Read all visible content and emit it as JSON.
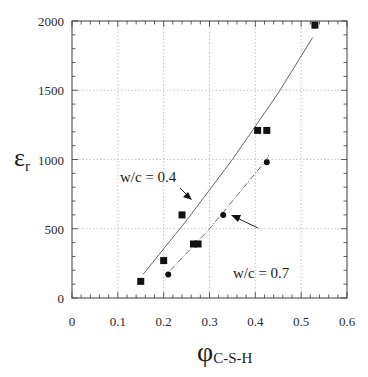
{
  "chart_data": {
    "type": "scatter",
    "title": "",
    "xlabel": "φ",
    "xlabel_subscript": "C-S-H",
    "ylabel": "ε",
    "ylabel_subscript": "r",
    "xlim": [
      0,
      0.6
    ],
    "ylim": [
      0,
      2000
    ],
    "x_ticks": [
      "0",
      "0.1",
      "0.2",
      "0.3",
      "0.4",
      "0.5",
      "0.6"
    ],
    "y_ticks": [
      "0",
      "500",
      "1000",
      "1500",
      "2000"
    ],
    "grid": true,
    "grid_style": "dotted",
    "legend": null,
    "series": [
      {
        "name": "w/c = 0.4",
        "marker": "square",
        "points": [
          {
            "x": 0.15,
            "y": 120
          },
          {
            "x": 0.2,
            "y": 270
          },
          {
            "x": 0.24,
            "y": 600
          },
          {
            "x": 0.265,
            "y": 390
          },
          {
            "x": 0.275,
            "y": 390
          },
          {
            "x": 0.405,
            "y": 1210
          },
          {
            "x": 0.425,
            "y": 1210
          },
          {
            "x": 0.53,
            "y": 1970
          }
        ],
        "fit_line": {
          "style": "solid-thin",
          "points": [
            {
              "x": 0.155,
              "y": 170
            },
            {
              "x": 0.25,
              "y": 560
            },
            {
              "x": 0.35,
              "y": 1000
            },
            {
              "x": 0.45,
              "y": 1480
            },
            {
              "x": 0.525,
              "y": 1880
            }
          ]
        }
      },
      {
        "name": "w/c = 0.7",
        "marker": "circle",
        "points": [
          {
            "x": 0.21,
            "y": 170
          },
          {
            "x": 0.33,
            "y": 600
          },
          {
            "x": 0.425,
            "y": 980
          }
        ],
        "fit_line": {
          "style": "dash-dot-thin",
          "points": [
            {
              "x": 0.215,
              "y": 200
            },
            {
              "x": 0.3,
              "y": 500
            },
            {
              "x": 0.36,
              "y": 740
            },
            {
              "x": 0.425,
              "y": 1000
            },
            {
              "x": 0.43,
              "y": 1040
            }
          ]
        }
      }
    ],
    "annotations": [
      {
        "text": "w/c = 0.4",
        "arrow_to": {
          "x": 0.235,
          "y": 750
        }
      },
      {
        "text": "w/c = 0.7",
        "arrow_to": {
          "x": 0.34,
          "y": 640
        }
      }
    ]
  },
  "axes": {
    "x_ticks": [
      "0",
      "0.1",
      "0.2",
      "0.3",
      "0.4",
      "0.5",
      "0.6"
    ],
    "y_ticks": [
      "0",
      "500",
      "1000",
      "1500",
      "2000"
    ],
    "xlabel_main": "φ",
    "xlabel_sub": "C-S-H",
    "ylabel_main": "ε",
    "ylabel_sub": "r"
  },
  "annotations": {
    "wc04": "w/c = 0.4",
    "wc07": "w/c = 0.7"
  },
  "colors": {
    "axis": "#3a3a3a",
    "grid": "#b5b5b5",
    "marker": "#111111",
    "fit_line": "#555555"
  }
}
